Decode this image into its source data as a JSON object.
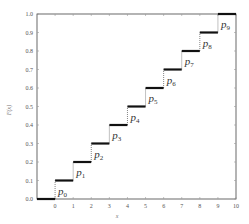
{
  "chart_data": {
    "type": "line",
    "subtype": "step-cdf",
    "title": "",
    "xlabel": "x",
    "ylabel": "F(x)",
    "xlim": [
      -1,
      10
    ],
    "ylim": [
      0,
      1
    ],
    "x_ticks": [
      "0",
      "1",
      "2",
      "3",
      "4",
      "5",
      "6",
      "7",
      "8",
      "9",
      "10"
    ],
    "y_ticks": [
      "0.0",
      "0.1",
      "0.2",
      "0.3",
      "0.4",
      "0.5",
      "0.6",
      "0.7",
      "0.8",
      "0.9",
      "1.0"
    ],
    "grid": false,
    "legend": null,
    "steps": [
      {
        "x_start": -1,
        "x_end": 0,
        "y": 0.0
      },
      {
        "x_start": 0,
        "x_end": 1,
        "y": 0.1
      },
      {
        "x_start": 1,
        "x_end": 2,
        "y": 0.2
      },
      {
        "x_start": 2,
        "x_end": 3,
        "y": 0.3
      },
      {
        "x_start": 3,
        "x_end": 4,
        "y": 0.4
      },
      {
        "x_start": 4,
        "x_end": 5,
        "y": 0.5
      },
      {
        "x_start": 5,
        "x_end": 6,
        "y": 0.6
      },
      {
        "x_start": 6,
        "x_end": 7,
        "y": 0.7
      },
      {
        "x_start": 7,
        "x_end": 8,
        "y": 0.8
      },
      {
        "x_start": 8,
        "x_end": 9,
        "y": 0.9
      },
      {
        "x_start": 9,
        "x_end": 10,
        "y": 1.0
      }
    ],
    "jumps": [
      {
        "x": 0,
        "from": 0.0,
        "to": 0.1,
        "label": "p",
        "sub": "0"
      },
      {
        "x": 1,
        "from": 0.1,
        "to": 0.2,
        "label": "p",
        "sub": "1"
      },
      {
        "x": 2,
        "from": 0.2,
        "to": 0.3,
        "label": "p",
        "sub": "2"
      },
      {
        "x": 3,
        "from": 0.3,
        "to": 0.4,
        "label": "p",
        "sub": "3"
      },
      {
        "x": 4,
        "from": 0.4,
        "to": 0.5,
        "label": "p",
        "sub": "4"
      },
      {
        "x": 5,
        "from": 0.5,
        "to": 0.6,
        "label": "p",
        "sub": "5"
      },
      {
        "x": 6,
        "from": 0.6,
        "to": 0.7,
        "label": "p",
        "sub": "6"
      },
      {
        "x": 7,
        "from": 0.7,
        "to": 0.8,
        "label": "p",
        "sub": "7"
      },
      {
        "x": 8,
        "from": 0.8,
        "to": 0.9,
        "label": "p",
        "sub": "8"
      },
      {
        "x": 9,
        "from": 0.9,
        "to": 1.0,
        "label": "p",
        "sub": "9"
      }
    ],
    "colors": {
      "step": "#111111",
      "jump": "#666666",
      "frame": "#444444",
      "tick": "#999999"
    }
  }
}
